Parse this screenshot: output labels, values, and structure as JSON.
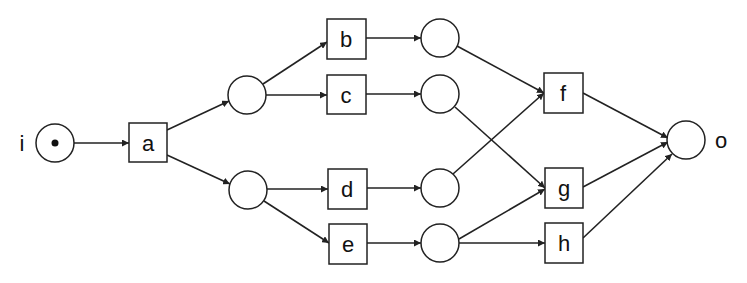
{
  "diagram": {
    "type": "petri-net",
    "places": [
      {
        "id": "i",
        "label": "i",
        "cx": 55,
        "cy": 143,
        "tokens": 1
      },
      {
        "id": "p1",
        "label": "",
        "cx": 247,
        "cy": 95,
        "tokens": 0
      },
      {
        "id": "p2",
        "label": "",
        "cx": 248,
        "cy": 190,
        "tokens": 0
      },
      {
        "id": "p3",
        "label": "",
        "cx": 440,
        "cy": 38,
        "tokens": 0
      },
      {
        "id": "p4",
        "label": "",
        "cx": 440,
        "cy": 94,
        "tokens": 0
      },
      {
        "id": "p5",
        "label": "",
        "cx": 440,
        "cy": 188,
        "tokens": 0
      },
      {
        "id": "p6",
        "label": "",
        "cx": 440,
        "cy": 243,
        "tokens": 0
      },
      {
        "id": "o",
        "label": "o",
        "cx": 686,
        "cy": 140,
        "tokens": 0
      }
    ],
    "transitions": [
      {
        "id": "a",
        "label": "a",
        "x": 129,
        "y": 123
      },
      {
        "id": "b",
        "label": "b",
        "x": 327,
        "y": 19
      },
      {
        "id": "c",
        "label": "c",
        "x": 327,
        "y": 75
      },
      {
        "id": "d",
        "label": "d",
        "x": 328,
        "y": 169
      },
      {
        "id": "e",
        "label": "e",
        "x": 329,
        "y": 224
      },
      {
        "id": "f",
        "label": "f",
        "x": 544,
        "y": 73
      },
      {
        "id": "g",
        "label": "g",
        "x": 545,
        "y": 168
      },
      {
        "id": "h",
        "label": "h",
        "x": 545,
        "y": 223
      }
    ],
    "arcs": [
      {
        "from": "i",
        "to": "a"
      },
      {
        "from": "a",
        "to": "p1"
      },
      {
        "from": "a",
        "to": "p2"
      },
      {
        "from": "p1",
        "to": "b"
      },
      {
        "from": "p1",
        "to": "c"
      },
      {
        "from": "p2",
        "to": "d"
      },
      {
        "from": "p2",
        "to": "e"
      },
      {
        "from": "b",
        "to": "p3"
      },
      {
        "from": "c",
        "to": "p4"
      },
      {
        "from": "d",
        "to": "p5"
      },
      {
        "from": "e",
        "to": "p6"
      },
      {
        "from": "p3",
        "to": "f"
      },
      {
        "from": "p4",
        "to": "g"
      },
      {
        "from": "p5",
        "to": "f"
      },
      {
        "from": "p6",
        "to": "g"
      },
      {
        "from": "p6",
        "to": "h"
      },
      {
        "from": "f",
        "to": "o"
      },
      {
        "from": "g",
        "to": "o"
      },
      {
        "from": "h",
        "to": "o"
      }
    ],
    "external_labels": {
      "input_place": "i",
      "output_place": "o"
    }
  },
  "labels": {
    "i": "i",
    "o": "o",
    "a": "a",
    "b": "b",
    "c": "c",
    "d": "d",
    "e": "e",
    "f": "f",
    "g": "g",
    "h": "h"
  }
}
